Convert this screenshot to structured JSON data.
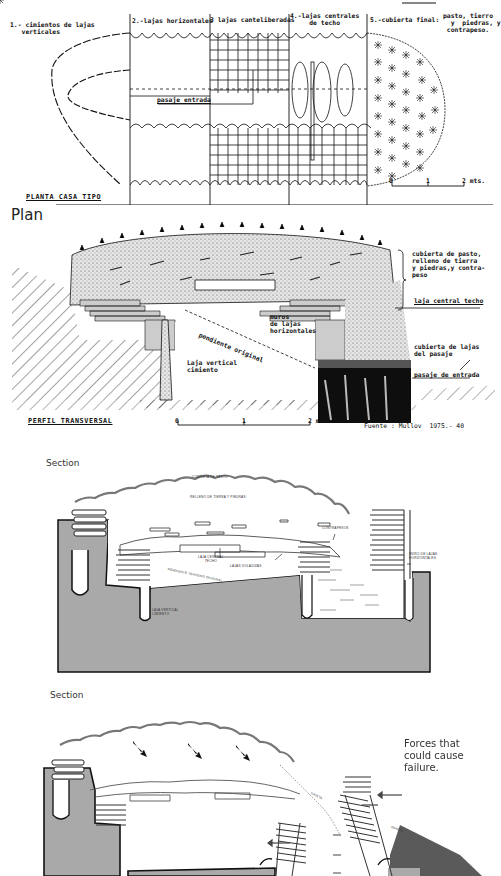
{
  "plan": {
    "labels": {
      "foundation": "1.- cimientos de lajas\n   verticales",
      "horizontal": "2.-lajas horizontales",
      "cantilevered": "3 lajas canteliberadas",
      "central": "4.-lajas centrales\n     de techo",
      "cover": "5.-cubierta final:",
      "cover_detail": "pasto, tierro\n  y  piedras, y\n contrapeso.",
      "passage": "pasaje entrada",
      "title": "PLANTA CASA TIPO"
    },
    "scale": {
      "zero": "0",
      "one": "1",
      "two": "2 mts."
    },
    "caption": "Plan"
  },
  "profile": {
    "labels": {
      "cover_fill": "cubierta de pasto,\nrelleno de tierra\ny piedras,y contra-\npeso",
      "central_slab": "laja central techo",
      "walls": "muros\nde lajas\nhorizontales",
      "slope": "pendiente original",
      "vertical_slab": "Laja vertical\ncimiento",
      "passage_cover": "cubierta de lajas\ndel pasaje",
      "passage_entry": "pasaje de entrada",
      "title": "PERFIL TRANSVERSAL"
    },
    "scale": {
      "zero": "0",
      "one": "1",
      "two": "2 mts."
    },
    "source": "Fuente : Mullov  1975.- 40"
  },
  "section1": {
    "caption": "Section",
    "labels": {
      "grass_cover": "CUBIERTA DE PASTO",
      "earth_fill": "RELLENO DE TIERRA Y PIEDRAS",
      "counterweight": "CONTRAPESOS",
      "central_slab": "LAJA CENTRAL\nTECHO",
      "cantilever_slabs": "LAJAS VOLADIZAS",
      "original_slope": "PENDIENTE TERRENO ORIGINAL",
      "horizontal_walls": "MURO DE LAJAS\nHORIZONTALES",
      "vertical_slab": "LAJA VERTICAL\nCIMIENTO"
    }
  },
  "section2": {
    "caption": "Section",
    "annotation": "Forces that\ncould cause\nfailure.",
    "labels": {
      "crack1": "GRIETA",
      "crack2": "GRIETA"
    }
  },
  "colors": {
    "ink": "#111111",
    "ground_gray": "#a9a9a9",
    "dark_fill": "#5a5a5a",
    "passage_black": "#0e0e0e"
  }
}
